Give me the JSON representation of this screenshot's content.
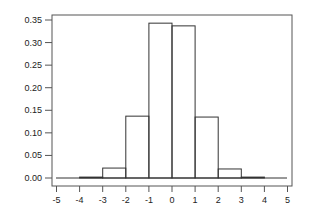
{
  "chart_data": {
    "type": "bar",
    "subtype": "histogram",
    "title": "",
    "xlabel": "",
    "ylabel": "",
    "bins": [
      {
        "x0": -5,
        "x1": -4,
        "value": 0.0
      },
      {
        "x0": -4,
        "x1": -3,
        "value": 0.002
      },
      {
        "x0": -3,
        "x1": -2,
        "value": 0.022
      },
      {
        "x0": -2,
        "x1": -1,
        "value": 0.137
      },
      {
        "x0": -1,
        "x1": 0,
        "value": 0.343
      },
      {
        "x0": 0,
        "x1": 1,
        "value": 0.337
      },
      {
        "x0": 1,
        "x1": 2,
        "value": 0.135
      },
      {
        "x0": 2,
        "x1": 3,
        "value": 0.02
      },
      {
        "x0": 3,
        "x1": 4,
        "value": 0.002
      },
      {
        "x0": 4,
        "x1": 5,
        "value": 0.0
      }
    ],
    "xlim": [
      -5,
      5
    ],
    "ylim": [
      0,
      0.35
    ],
    "x_ticks": [
      "-5",
      "-4",
      "-3",
      "-2",
      "-1",
      "0",
      "1",
      "2",
      "3",
      "4",
      "5"
    ],
    "y_ticks": [
      "0.00",
      "0.05",
      "0.10",
      "0.15",
      "0.20",
      "0.25",
      "0.30",
      "0.35"
    ],
    "grid": false,
    "legend": null
  }
}
